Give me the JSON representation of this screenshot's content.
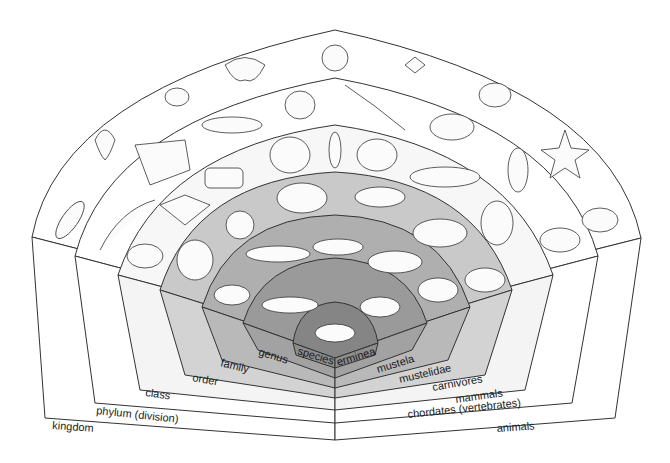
{
  "diagram": {
    "ranks": [
      {
        "rank": "kingdom",
        "taxon": "animals",
        "fill": "#ffffff"
      },
      {
        "rank": "phylum (division)",
        "taxon": "chordates (vertebrates)",
        "fill": "#ffffff"
      },
      {
        "rank": "class",
        "taxon": "mammals",
        "fill": "#f7f7f7"
      },
      {
        "rank": "order",
        "taxon": "carnivores",
        "fill": "#c9c9c9"
      },
      {
        "rank": "family",
        "taxon": "mustelidae",
        "fill": "#afafaf"
      },
      {
        "rank": "genus",
        "taxon": "mustela",
        "fill": "#9a9a9a"
      },
      {
        "rank": "species",
        "taxon": "erminea",
        "fill": "#858585"
      }
    ],
    "animals_by_band": {
      "kingdom": [
        "paramecium",
        "sea anemone",
        "jellyfish",
        "octopus",
        "snail",
        "spider",
        "beetle",
        "starfish",
        "stoat"
      ],
      "phylum": [
        "eel",
        "stingray",
        "fish",
        "frog",
        "lizard",
        "tortoise",
        "bird",
        "stoat"
      ],
      "class": [
        "hedgehog",
        "bat",
        "cow",
        "elephant",
        "human",
        "ape",
        "whale",
        "wolf",
        "stoat"
      ],
      "order": [
        "dog",
        "cat",
        "polar bear",
        "seal",
        "hyena",
        "stoat"
      ],
      "family": [
        "badger",
        "otter",
        "weasel",
        "wolverine",
        "stoat"
      ],
      "genus": [
        "mink",
        "stoat",
        "stoat"
      ],
      "species": [
        "stoat"
      ]
    }
  }
}
